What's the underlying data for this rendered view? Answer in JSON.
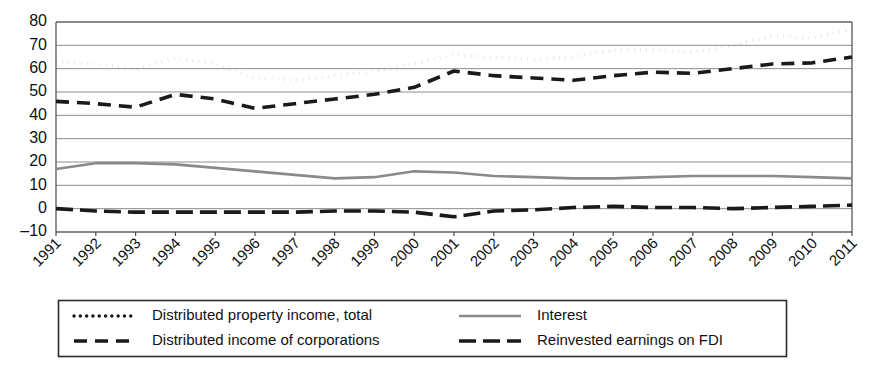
{
  "chart_data": {
    "type": "line",
    "title": "",
    "subtitle": "",
    "xlabel": "",
    "ylabel": "",
    "grid": true,
    "legend_position": "bottom",
    "ylim": [
      -10,
      80
    ],
    "yticks": [
      -10,
      0,
      10,
      20,
      30,
      40,
      50,
      60,
      70,
      80
    ],
    "ytick_labels": [
      "–10",
      "0",
      "10",
      "20",
      "30",
      "40",
      "50",
      "60",
      "70",
      "80"
    ],
    "x": [
      1991,
      1992,
      1993,
      1994,
      1995,
      1996,
      1997,
      1998,
      1999,
      2000,
      2001,
      2002,
      2003,
      2004,
      2005,
      2006,
      2007,
      2008,
      2009,
      2010,
      2011
    ],
    "xtick_labels": [
      "1991",
      "1992",
      "1993",
      "1994",
      "1995",
      "1996",
      "1997",
      "1998",
      "1999",
      "2000",
      "2001",
      "2002",
      "2003",
      "2004",
      "2005",
      "2006",
      "2007",
      "2008",
      "2009",
      "2010",
      "2011"
    ],
    "series": [
      {
        "name": "Distributed property income, total",
        "style": "dotted",
        "color": "#1a1a1a",
        "values": [
          63,
          62,
          60,
          64.5,
          62,
          56,
          55,
          57,
          59,
          62,
          66,
          65,
          64,
          65,
          68,
          68,
          67,
          70,
          74,
          73,
          77
        ]
      },
      {
        "name": "Distributed income of corporations",
        "style": "dashed",
        "color": "#1a1a1a",
        "values": [
          46,
          45,
          43.5,
          49,
          47,
          43,
          45,
          47,
          49,
          52,
          59,
          57,
          56,
          55,
          57,
          58.5,
          58,
          60,
          62,
          62.5,
          65
        ]
      },
      {
        "name": "Interest",
        "style": "solid",
        "color": "#8a8a8a",
        "values": [
          17,
          19.5,
          19.5,
          19,
          17.5,
          16,
          14.5,
          13,
          13.5,
          16,
          15.5,
          14,
          13.5,
          13,
          13,
          13.5,
          14,
          14,
          14,
          13.5,
          13
        ]
      },
      {
        "name": "Reinvested earnings on FDI",
        "style": "dashed-thick",
        "color": "#1a1a1a",
        "values": [
          0,
          -1,
          -1.5,
          -1.5,
          -1.5,
          -1.5,
          -1.5,
          -1,
          -1,
          -1.5,
          -3.5,
          -1,
          -0.5,
          0.5,
          1,
          0.5,
          0.5,
          0,
          0.5,
          1,
          1.5
        ]
      }
    ]
  },
  "legend": {
    "items": [
      {
        "label": "Distributed property income, total",
        "swatch": "dotted-swatch"
      },
      {
        "label": "Distributed income of corporations",
        "swatch": "dashed-swatch"
      },
      {
        "label": "Interest",
        "swatch": "solid-swatch"
      },
      {
        "label": "Reinvested earnings on FDI",
        "swatch": "dashed-thick-swatch"
      }
    ]
  }
}
